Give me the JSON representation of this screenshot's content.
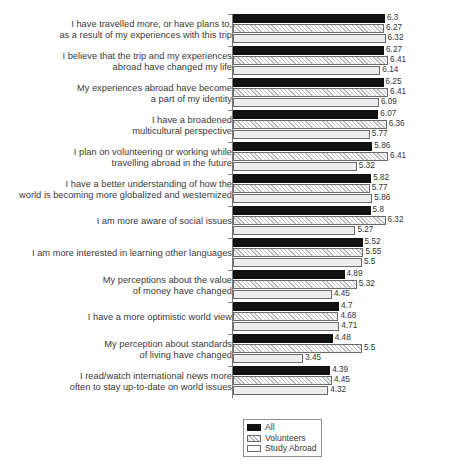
{
  "chart_data": {
    "type": "bar",
    "orientation": "horizontal",
    "title": "",
    "subtitle": "",
    "xlabel": "",
    "ylabel": "",
    "xlim": [
      1,
      7
    ],
    "grid": false,
    "legend_position": "bottom-center",
    "value_label_format": "2 significant decimals, trailing zeros trimmed",
    "categories": [
      "I have travelled more, or have plans to,\nas a result of my experiences with this trip",
      "I believe that the trip and my experiences\nabroad have changed my life",
      "My experiences abroad have become\na part of my identity",
      "I have a broadened\nmulticultural perspective",
      "I plan on volunteering or working while\ntravelling abroad in the future",
      "I have a better understanding of how the\nworld is becoming more globalized and westernized",
      "I am more aware of social issues",
      "I am more interested in learning other languages",
      "My perceptions about the value\nof money have changed",
      "I have a more optimistic world view",
      "My perception about standards\nof living have changed",
      "I read/watch international news more\noften to stay up-to-date on world issues"
    ],
    "series": [
      {
        "name": "All",
        "fill": "solid-black",
        "color": "#111111",
        "values": [
          6.3,
          6.27,
          6.25,
          6.07,
          5.86,
          5.82,
          5.8,
          5.52,
          4.89,
          4.7,
          4.48,
          4.39
        ],
        "labels": [
          "6.3",
          "6.27",
          "6.25",
          "6.07",
          "5.86",
          "5.82",
          "5.8",
          "5.52",
          "4.89",
          "4.7",
          "4.48",
          "4.39"
        ]
      },
      {
        "name": "Volunteers",
        "fill": "diagonal-hatch",
        "color": "#f2f2f2",
        "values": [
          6.27,
          6.41,
          6.41,
          6.36,
          6.41,
          5.77,
          6.32,
          5.55,
          5.32,
          4.68,
          5.5,
          4.45
        ],
        "labels": [
          "6.27",
          "6.41",
          "6.41",
          "6.36",
          "6.41",
          "5.77",
          "6.32",
          "5.55",
          "5.32",
          "4.68",
          "5.5",
          "4.45"
        ]
      },
      {
        "name": "Study Abroad",
        "fill": "light-gray",
        "color": "#eeeeee",
        "values": [
          6.32,
          6.14,
          6.09,
          5.77,
          5.32,
          5.86,
          5.27,
          5.5,
          4.45,
          4.71,
          3.45,
          4.32
        ],
        "labels": [
          "6.32",
          "6.14",
          "6.09",
          "5.77",
          "5.32",
          "5.86",
          "5.27",
          "5.5",
          "4.45",
          "4.71",
          "3.45",
          "4.32"
        ]
      }
    ],
    "legend": [
      {
        "label": "All",
        "fill": "solid-black"
      },
      {
        "label": "Volunteers",
        "fill": "diagonal-hatch"
      },
      {
        "label": "Study Abroad",
        "fill": "light-gray"
      }
    ]
  }
}
